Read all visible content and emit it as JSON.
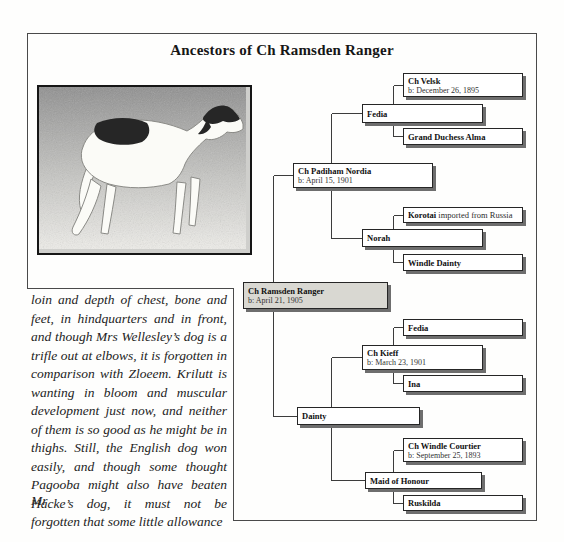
{
  "page": {
    "title": "Ancestors of Ch Ramsden Ranger"
  },
  "tree": {
    "boxes": [
      {
        "name": "Ch Velsk",
        "birth": "b: December 26, 1895"
      },
      {
        "name": "Fedia"
      },
      {
        "name": "Grand Duchess Alma"
      },
      {
        "name": "Ch Padiham Nordia",
        "birth": "b: April 15, 1901"
      },
      {
        "name": "Korotai",
        "suffix": " imported from Russia"
      },
      {
        "name": "Norah"
      },
      {
        "name": "Windle Dainty"
      },
      {
        "name": "Ch Ramsden Ranger",
        "birth": "b: April 21, 1905"
      },
      {
        "name": "Fedia"
      },
      {
        "name": "Ch Kieff",
        "birth": "b: March 23, 1901"
      },
      {
        "name": "Ina"
      },
      {
        "name": "Dainty"
      },
      {
        "name": "Ch Windle Courtier",
        "birth": "b: September 25, 1893"
      },
      {
        "name": "Maid of Honour"
      },
      {
        "name": "Ruskilda"
      }
    ]
  },
  "text_block": {
    "lines": [
      "loin and depth of chest, bone and",
      "feet, in hindquarters and in front,",
      "and though Mrs Wellesley’s dog is a",
      "trifle out at elbows, it is forgotten in",
      "comparison with Zloeem. Krilutt is",
      "wanting in bloom and muscular",
      "development just now, and neither",
      "of them is so good as he might be in",
      "thighs. Still, the English dog won",
      "easily, and though some thought",
      "Pagooba might also have beaten Mr",
      "Hacke’s dog, it must not be",
      "forgotten that some little allowance"
    ]
  },
  "colors": {
    "outer_border": "#4a4a4a",
    "connector_line": "#3c3c3c",
    "box_border": "#262626",
    "box_fill": "#ffffff",
    "root_box_fill": "#d9d8d2",
    "box_shadow": "#6e6e6e"
  }
}
